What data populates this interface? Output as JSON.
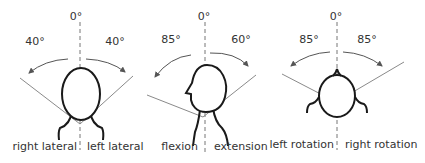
{
  "diagram": {
    "panels": [
      {
        "id": "lateral",
        "zero_label": "0°",
        "left_angle": "40°",
        "right_angle": "40°",
        "left_caption": "right lateral",
        "right_caption": "left lateral"
      },
      {
        "id": "flexion-extension",
        "zero_label": "0°",
        "left_angle": "85°",
        "right_angle": "60°",
        "left_caption": "flexion",
        "right_caption": "extension"
      },
      {
        "id": "rotation",
        "zero_label": "0°",
        "left_angle": "85°",
        "right_angle": "85°",
        "left_caption": "left rotation",
        "right_caption": "right rotation"
      }
    ],
    "colors": {
      "outline": "#1a1a1a",
      "limit_lines": "#8a8a8a",
      "axis": "#777777",
      "text": "#333333"
    }
  }
}
